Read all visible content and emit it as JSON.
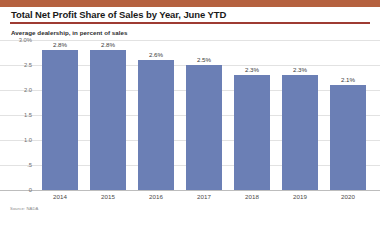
{
  "header": {
    "title": "Total Net Profit Share of Sales by Year, June YTD",
    "subtitle": "Average dealership, in percent of sales",
    "accent_color": "#b5613f",
    "rule_color": "#9e3b32"
  },
  "footer": {
    "source": "Source: NADA"
  },
  "chart_data": {
    "type": "bar",
    "title": "Total Net Profit Share of Sales by Year, June YTD",
    "subtitle": "Average dealership, in percent of sales",
    "xlabel": "",
    "ylabel": "",
    "categories": [
      "2014",
      "2015",
      "2016",
      "2017",
      "2018",
      "2019",
      "2020"
    ],
    "values": [
      2.8,
      2.8,
      2.6,
      2.5,
      2.3,
      2.3,
      2.1
    ],
    "data_labels": [
      "2.8%",
      "2.8%",
      "2.6%",
      "2.5%",
      "2.3%",
      "2.3%",
      "2.1%"
    ],
    "ylim": [
      0,
      3.0
    ],
    "yticks": [
      3.0,
      2.5,
      2.0,
      1.5,
      1.0,
      0.5,
      0
    ],
    "ytick_labels": [
      "3.0%",
      "2.5",
      "2.0",
      "1.5",
      "1.0",
      ".5",
      "0"
    ],
    "grid": true,
    "legend": false,
    "bar_color": "#6b7fb5"
  }
}
